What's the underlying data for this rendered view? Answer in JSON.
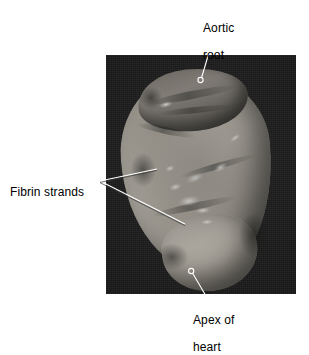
{
  "figure": {
    "type": "labeled-photograph",
    "background_color": "#ffffff",
    "photo": {
      "name": "heart-specimen-photo",
      "background_color": "#181818",
      "specimen_color": "#a9a49a",
      "bounds": {
        "x": 106,
        "y": 55,
        "width": 190,
        "height": 239
      }
    },
    "callouts": [
      {
        "id": "aortic-root",
        "text": "Aortic\nroot",
        "line1": "Aortic",
        "line2": "root",
        "marker": {
          "x": 200,
          "y": 80
        },
        "label_position": {
          "x": 203,
          "y": 8
        },
        "leader_color": "#ffffff"
      },
      {
        "id": "fibrin-strands",
        "text": "Fibrin strands",
        "line1": "Fibrin strands",
        "line2": "",
        "marker_upper": {
          "x": 158,
          "y": 169
        },
        "marker_lower": {
          "x": 186,
          "y": 224
        },
        "vertex": {
          "x": 100,
          "y": 181
        },
        "label_position": {
          "x": 10,
          "y": 172
        },
        "leader_color": "#ffffff"
      },
      {
        "id": "apex-of-heart",
        "text": "Apex of\nheart",
        "line1": "Apex of",
        "line2": "heart",
        "marker": {
          "x": 191,
          "y": 271
        },
        "label_position": {
          "x": 193,
          "y": 300
        },
        "leader_color": "#ffffff"
      }
    ]
  }
}
